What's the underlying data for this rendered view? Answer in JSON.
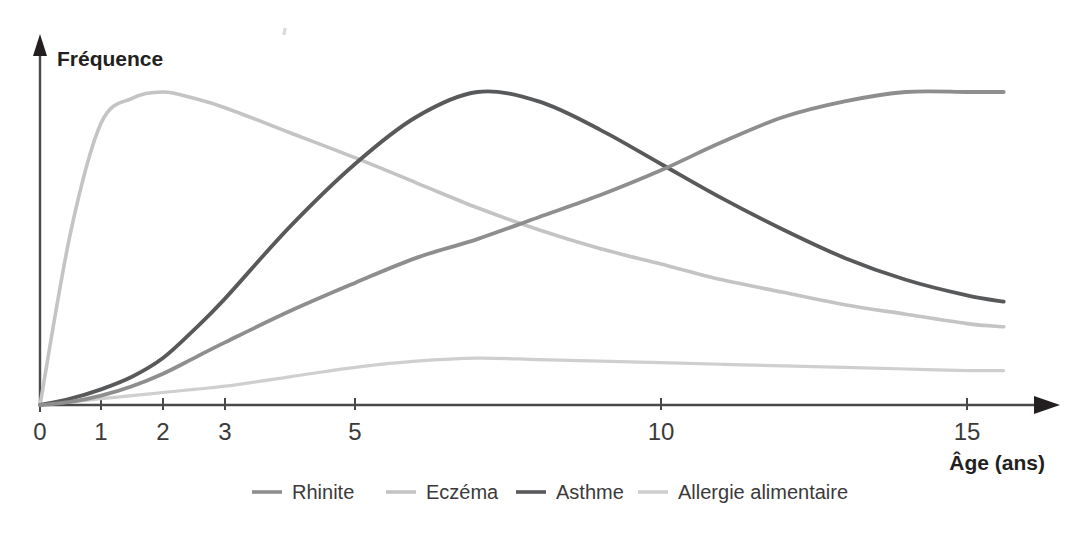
{
  "chart_data": {
    "type": "line",
    "title": "",
    "xlabel": "Âge (ans)",
    "ylabel": "Fréquence",
    "grid": false,
    "legend_position": "bottom",
    "x_tick_labels": [
      "0",
      "1",
      "2",
      "3",
      "5",
      "10",
      "15"
    ],
    "x_tick_values": [
      0,
      1,
      2,
      3,
      5,
      10,
      15
    ],
    "x_axis_note": "compressed non-linear age axis",
    "y_axis_note": "unlabelled relative frequency",
    "xlim": [
      0,
      15.8
    ],
    "ylim": [
      0,
      1
    ],
    "x": [
      0,
      0.5,
      1,
      1.5,
      2,
      2.5,
      3,
      4,
      5,
      6,
      7,
      8,
      9,
      10,
      11,
      12,
      13,
      14,
      15,
      15.6
    ],
    "series": [
      {
        "name": "Rhinite",
        "color": "#8e8e8e",
        "values": [
          0.0,
          0.01,
          0.03,
          0.06,
          0.1,
          0.15,
          0.2,
          0.3,
          0.39,
          0.47,
          0.53,
          0.6,
          0.67,
          0.75,
          0.84,
          0.92,
          0.97,
          1.0,
          1.0,
          1.0
        ]
      },
      {
        "name": "Eczéma",
        "color": "#c4c4c4",
        "values": [
          0.0,
          0.55,
          0.9,
          0.98,
          1.0,
          0.98,
          0.95,
          0.87,
          0.79,
          0.71,
          0.63,
          0.56,
          0.5,
          0.45,
          0.4,
          0.36,
          0.32,
          0.29,
          0.26,
          0.25
        ]
      },
      {
        "name": "Asthme",
        "color": "#58595b",
        "values": [
          0.0,
          0.02,
          0.05,
          0.09,
          0.15,
          0.24,
          0.34,
          0.57,
          0.77,
          0.92,
          1.0,
          0.97,
          0.88,
          0.77,
          0.66,
          0.56,
          0.47,
          0.4,
          0.35,
          0.33
        ]
      },
      {
        "name": "Allergie alimentaire",
        "color": "#cfcfcf",
        "values": [
          0.0,
          0.01,
          0.02,
          0.03,
          0.04,
          0.05,
          0.06,
          0.09,
          0.12,
          0.14,
          0.15,
          0.145,
          0.14,
          0.135,
          0.13,
          0.125,
          0.12,
          0.115,
          0.11,
          0.11
        ]
      }
    ],
    "peaks": [
      {
        "series": "Eczéma",
        "age": 1.8,
        "value": 1.0
      },
      {
        "series": "Asthme",
        "age": 7.2,
        "value": 1.0
      },
      {
        "series": "Allergie alimentaire",
        "age": 6.9,
        "value": 0.15
      },
      {
        "series": "Rhinite",
        "age": 14.2,
        "value": 1.0
      }
    ]
  },
  "axes": {
    "y_title": "Fréquence",
    "x_title": "Âge (ans)"
  },
  "legend": {
    "items": [
      {
        "label": "Rhinite",
        "color": "#8e8e8e"
      },
      {
        "label": "Eczéma",
        "color": "#c4c4c4"
      },
      {
        "label": "Asthme",
        "color": "#58595b"
      },
      {
        "label": "Allergie alimentaire",
        "color": "#cfcfcf"
      }
    ]
  }
}
